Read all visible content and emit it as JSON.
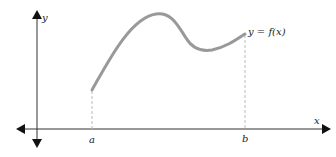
{
  "diagram": {
    "labels": {
      "y_axis": "y",
      "x_axis": "x",
      "a": "a",
      "b": "b",
      "function": "y = f(x)"
    },
    "colors": {
      "axes": "#333333",
      "curve": "#999999",
      "dashed": "#bbbbbb",
      "text": "#222222"
    }
  }
}
